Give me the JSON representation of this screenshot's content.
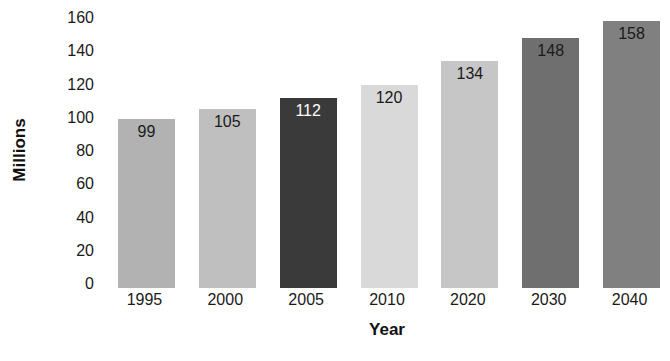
{
  "chart_data": {
    "type": "bar",
    "title": "",
    "subtitle": "",
    "xlabel": "Year",
    "ylabel": "Millions",
    "categories": [
      "1995",
      "2000",
      "2005",
      "2010",
      "2020",
      "2030",
      "2040"
    ],
    "values": [
      99,
      105,
      112,
      120,
      134,
      148,
      158
    ],
    "value_labels": [
      "99",
      "105",
      "112",
      "120",
      "134",
      "148",
      "158"
    ],
    "ylim": [
      0,
      160
    ],
    "ytick_labels": [
      "0",
      "20",
      "40",
      "60",
      "80",
      "100",
      "120",
      "140",
      "160"
    ],
    "ytick_values": [
      0,
      20,
      40,
      60,
      80,
      100,
      120,
      140,
      160
    ],
    "grid": false,
    "legend": "none",
    "bar_colors": [
      "#b2b2b2",
      "#bfbfbf",
      "#3a3a3a",
      "#d9d9d9",
      "#c6c6c6",
      "#6f6f6f",
      "#808080"
    ],
    "value_label_colors": [
      "#1a1a1a",
      "#1a1a1a",
      "#ffffff",
      "#1a1a1a",
      "#1a1a1a",
      "#1a1a1a",
      "#1a1a1a"
    ],
    "background_color": "#ffffff",
    "axis_text_color": "#1a1a1a"
  }
}
